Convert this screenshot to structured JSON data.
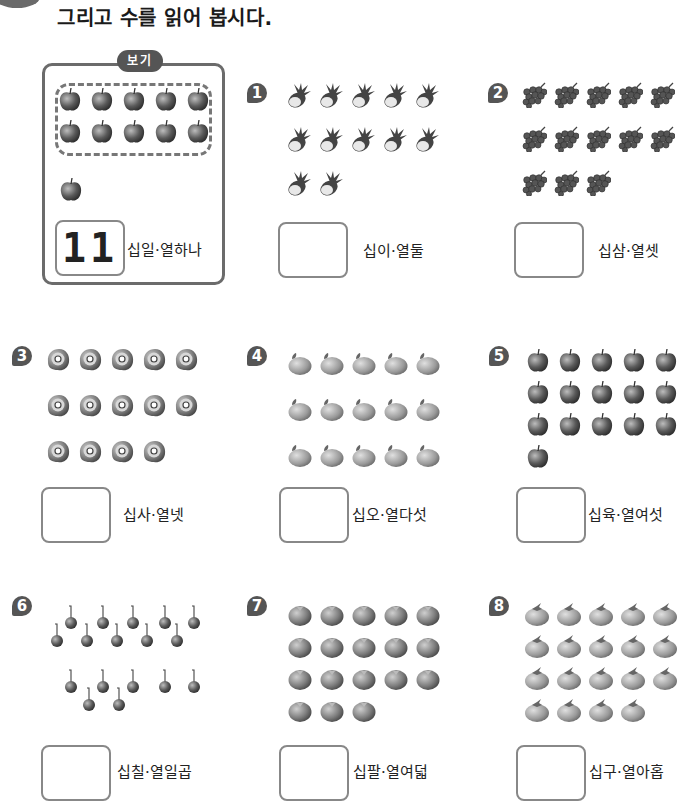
{
  "header": {
    "title": "그리고 수를 읽어 봅시다."
  },
  "example": {
    "tag_label": "보기",
    "fruit": "apple",
    "grouped_count": 10,
    "extra_count": 1,
    "answer": "11",
    "reading": "십일·열하나"
  },
  "problems": [
    {
      "number": "1",
      "fruit": "pineapple",
      "count": 12,
      "answer": "",
      "reading": "십이·열둘"
    },
    {
      "number": "2",
      "fruit": "grapes",
      "count": 13,
      "answer": "",
      "reading": "십삼·열셋"
    },
    {
      "number": "3",
      "fruit": "kiwi",
      "count": 14,
      "answer": "",
      "reading": "십사·열넷"
    },
    {
      "number": "4",
      "fruit": "peach",
      "count": 15,
      "answer": "",
      "reading": "십오·열다섯"
    },
    {
      "number": "5",
      "fruit": "apple",
      "count": 16,
      "answer": "",
      "reading": "십육·열여섯"
    },
    {
      "number": "6",
      "fruit": "cherry",
      "count": 17,
      "answer": "",
      "reading": "십칠·열일곱"
    },
    {
      "number": "7",
      "fruit": "tomato",
      "count": 18,
      "answer": "",
      "reading": "십팔·열여덟"
    },
    {
      "number": "8",
      "fruit": "persimmon",
      "count": 19,
      "answer": "",
      "reading": "십구·열아홉"
    }
  ]
}
